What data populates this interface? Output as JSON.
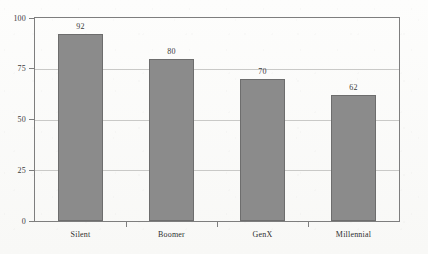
{
  "chart_data": {
    "type": "bar",
    "title": "",
    "subtitle": "",
    "xlabel": "",
    "ylabel": "",
    "categories": [
      "Silent",
      "Boomer",
      "GenX",
      "Millennial"
    ],
    "values": [
      92,
      80,
      70,
      62
    ],
    "value_labels": [
      "92",
      "80",
      "70",
      "62"
    ],
    "ylim": [
      0,
      100
    ],
    "yticks": [
      0,
      25,
      50,
      75,
      100
    ],
    "ytick_labels": [
      "0",
      "25",
      "50",
      "75",
      "100"
    ],
    "grid": true,
    "grid_axis": "y",
    "legend": false,
    "legend_position": "none",
    "bar_color": "#8b8b8b",
    "bar_border_color": "#6d6d6d",
    "frame_color": "#7e7e7e",
    "gridline_color": "#c9c9c7",
    "background_color": "#fbfbfa",
    "text_color": "#333333"
  }
}
